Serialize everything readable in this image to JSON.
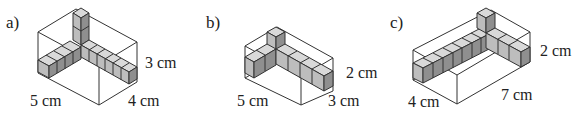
{
  "figures": [
    {
      "part_label": "a)",
      "dims": {
        "length": "5 cm",
        "width": "4 cm",
        "height": "3 cm"
      },
      "description": "Box 5×4×3 with skeleton of unit cubes along three edges from one corner"
    },
    {
      "part_label": "b)",
      "dims": {
        "length": "5 cm",
        "width": "3 cm",
        "height": "2 cm"
      },
      "description": "Box 5×3×2 with skeleton of unit cubes along three edges from one corner"
    },
    {
      "part_label": "c)",
      "dims": {
        "length": "7 cm",
        "width": "4 cm",
        "height": "2 cm"
      },
      "description": "Box 4×7×2 with skeleton of unit cubes along three edges from one corner"
    }
  ],
  "colors": {
    "cube_top": "#d9d9d9",
    "cube_front": "#bdbdbd",
    "cube_side": "#8f8f8f",
    "edge": "#333333"
  }
}
